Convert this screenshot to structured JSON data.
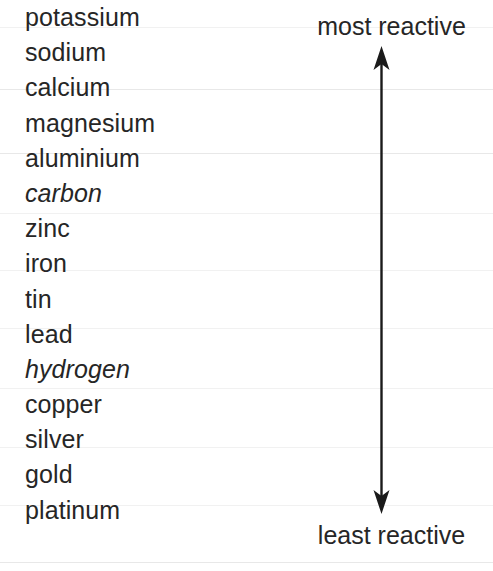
{
  "diagram": {
    "type": "reactivity-series",
    "series_items": [
      {
        "label": "potassium",
        "kind": "metal"
      },
      {
        "label": "sodium",
        "kind": "metal"
      },
      {
        "label": "calcium",
        "kind": "metal"
      },
      {
        "label": "magnesium",
        "kind": "metal"
      },
      {
        "label": "aluminium",
        "kind": "metal"
      },
      {
        "label": "carbon",
        "kind": "non-metal"
      },
      {
        "label": "zinc",
        "kind": "metal"
      },
      {
        "label": "iron",
        "kind": "metal"
      },
      {
        "label": "tin",
        "kind": "metal"
      },
      {
        "label": "lead",
        "kind": "metal"
      },
      {
        "label": "hydrogen",
        "kind": "non-metal"
      },
      {
        "label": "copper",
        "kind": "metal"
      },
      {
        "label": "silver",
        "kind": "metal"
      },
      {
        "label": "gold",
        "kind": "metal"
      },
      {
        "label": "platinum",
        "kind": "metal"
      }
    ],
    "scale": {
      "top_label": "most reactive",
      "bottom_label": "least reactive",
      "arrow": "double-headed-vertical-arrow"
    },
    "colors": {
      "text": "#262626",
      "arrow": "#1a1a1a",
      "rule": "#e8e8e8",
      "background": "#ffffff"
    }
  }
}
